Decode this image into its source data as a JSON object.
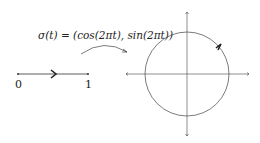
{
  "formula": "σ(t) = (cos(2πt), sin(2πt))",
  "interval": {
    "start_label": "0",
    "end_label": "1"
  },
  "colors": {
    "stroke": "#333333",
    "text": "#222222"
  }
}
